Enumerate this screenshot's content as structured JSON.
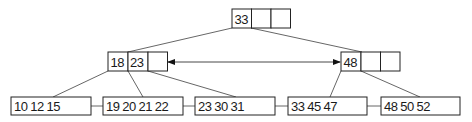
{
  "diagram": {
    "type": "B+ tree",
    "colors": {
      "stroke": "#222222",
      "edge": "#555555",
      "background": "#ffffff"
    },
    "root": {
      "keys": [
        "33",
        "",
        ""
      ]
    },
    "internal": [
      {
        "keys": [
          "18",
          "23",
          ""
        ]
      },
      {
        "keys": [
          "48",
          "",
          ""
        ]
      }
    ],
    "leaves": [
      {
        "label": "10 12 15"
      },
      {
        "label": "19 20 21 22"
      },
      {
        "label": "23 30 31"
      },
      {
        "label": "33 45 47"
      },
      {
        "label": "48 50 52"
      }
    ],
    "sibling_arrow": "bidirectional link between internal nodes"
  }
}
